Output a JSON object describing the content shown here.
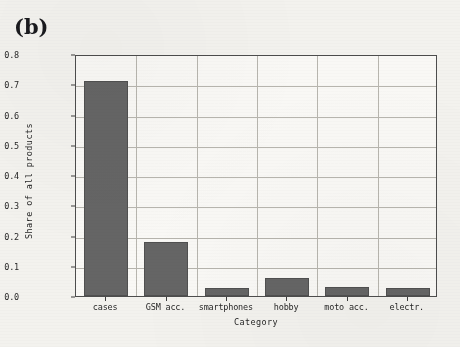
{
  "panel": {
    "label": "(b)"
  },
  "chart_data": {
    "type": "bar",
    "title": "",
    "subtitle": "",
    "xlabel": "Category",
    "ylabel": "Share of all products",
    "categories": [
      "cases",
      "GSM acc.",
      "smartphones",
      "hobby",
      "moto acc.",
      "electr."
    ],
    "values": [
      0.71,
      0.18,
      0.025,
      0.06,
      0.03,
      0.025
    ],
    "series": [
      {
        "name": "Share of all products",
        "values": [
          0.71,
          0.18,
          0.025,
          0.06,
          0.03,
          0.025
        ]
      }
    ],
    "ylim": [
      0.0,
      0.8
    ],
    "xlim": [
      0,
      6
    ],
    "yticks": [
      "0.0",
      "0.1",
      "0.2",
      "0.3",
      "0.4",
      "0.5",
      "0.6",
      "0.7",
      "0.8"
    ],
    "ytick_values": [
      0.0,
      0.1,
      0.2,
      0.3,
      0.4,
      0.5,
      0.6,
      0.7,
      0.8
    ],
    "grid": true,
    "legend": false,
    "legend_position": "none",
    "bar_color": "#636363",
    "axis_color": "#4a4a4a",
    "grid_color": "#b7b5ae",
    "background_color": "#fbfaf7"
  }
}
